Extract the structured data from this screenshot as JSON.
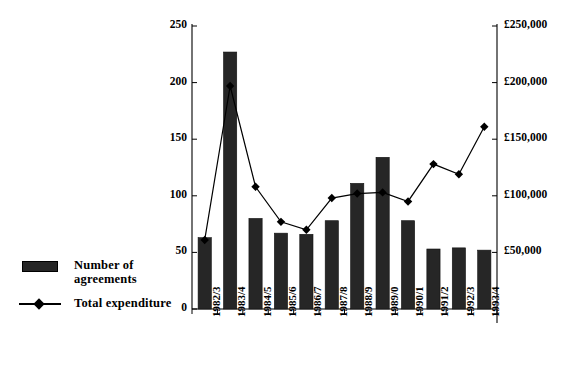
{
  "chart_data": {
    "type": "bar",
    "title": "",
    "subtitle": "",
    "xlabel": "",
    "ylabel": "",
    "categories": [
      "1982/3",
      "1983/4",
      "1984/5",
      "1985/6",
      "1986/7",
      "1987/8",
      "1988/9",
      "1989/0",
      "1990/1",
      "1991/2",
      "1992/3",
      "1993/4"
    ],
    "series": [
      {
        "name": "Number of agreements",
        "type": "bar",
        "axis": "left",
        "values": [
          63,
          227,
          80,
          67,
          66,
          78,
          111,
          134,
          78,
          53,
          54,
          52
        ]
      },
      {
        "name": "Total expenditure",
        "type": "line",
        "axis": "right",
        "values": [
          61000,
          197000,
          108000,
          77000,
          70000,
          98000,
          102000,
          103000,
          95000,
          128000,
          119000,
          161000
        ]
      }
    ],
    "left_axis": {
      "label": "",
      "ticks": [
        "0",
        "50",
        "100",
        "150",
        "200",
        "250"
      ],
      "tick_values": [
        0,
        50,
        100,
        150,
        200,
        250
      ],
      "ylim": [
        0,
        250
      ]
    },
    "right_axis": {
      "label": "",
      "ticks": [
        "",
        "£50,000",
        "£100,000",
        "£150,000",
        "£200,000",
        "£250,000"
      ],
      "tick_values": [
        0,
        50000,
        100000,
        150000,
        200000,
        250000
      ],
      "ylim": [
        0,
        250000
      ]
    },
    "grid": false,
    "legend_position": "left-bottom",
    "colors": {
      "bar": "#262626",
      "line": "#000000",
      "marker": "#000000",
      "axis": "#000000",
      "background": "#ffffff"
    }
  },
  "legend": {
    "items": [
      {
        "label_line1": "Number of",
        "label_line2": "agreements",
        "marker": "bar-swatch"
      },
      {
        "label_line1": "Total expenditure",
        "label_line2": "",
        "marker": "line-marker-swatch"
      }
    ]
  }
}
